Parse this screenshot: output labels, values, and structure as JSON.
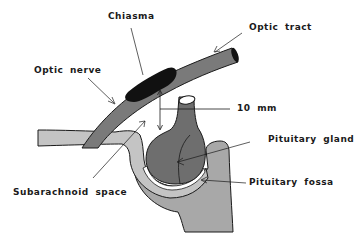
{
  "diagram": {
    "type": "anatomical-illustration",
    "labels": {
      "chiasma": "Chiasma",
      "optic_tract": "Optic tract",
      "optic_nerve": "Optic nerve",
      "distance": "10 mm",
      "pituitary_gland": "Pituitary gland",
      "subarachnoid_space": "Subarachnoid space",
      "pituitary_fossa": "Pituitary fossa"
    },
    "colors": {
      "nerve_fill": "#7a7a7a",
      "chiasma_fill": "#111111",
      "gland_fill": "#6e6e6e",
      "subarachnoid_fill": "#c4c4c4",
      "bone_fill": "#a8a8a8",
      "outline": "#1a1a1a",
      "background": "#ffffff"
    }
  }
}
